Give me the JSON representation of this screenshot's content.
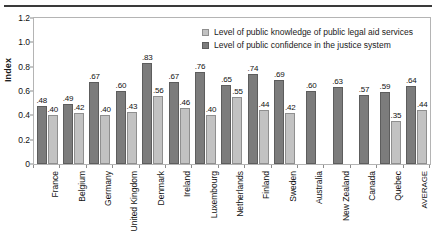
{
  "axis": {
    "ylabel": "Index",
    "yticks": [
      "0",
      "0.2",
      "0.4",
      "0.6",
      "0.8",
      "1.0",
      "1.2"
    ]
  },
  "legend": {
    "items": [
      {
        "label": "Level of public knowledge of public legal aid services",
        "swatch": "light",
        "color": "#c2c2c2"
      },
      {
        "label": "Level of public confidence in the justice system",
        "swatch": "dark",
        "color": "#7c7c7c"
      }
    ]
  },
  "chart_data": {
    "type": "bar",
    "title": "",
    "xlabel": "",
    "ylabel": "Index",
    "ylim": [
      0,
      1.2
    ],
    "ytick_step": 0.2,
    "grid": false,
    "legend_position": "top-right-inside",
    "categories": [
      "France",
      "Belgium",
      "Germany",
      "United Kingdom",
      "Denmark",
      "Ireland",
      "Luxembourg",
      "Netherlands",
      "Finland",
      "Sweden",
      "Australia",
      "New Zealand",
      "Canada",
      "Quebec",
      "AVERAGE"
    ],
    "series": [
      {
        "name": "Level of public confidence in the justice system",
        "color": "#7c7c7c",
        "values": [
          0.48,
          0.49,
          0.67,
          0.6,
          0.83,
          0.67,
          0.76,
          0.65,
          0.74,
          0.69,
          0.6,
          0.63,
          0.57,
          0.59,
          0.64
        ],
        "labels": [
          ".48",
          ".49",
          ".67",
          ".60",
          ".83",
          ".67",
          ".76",
          ".65",
          ".74",
          ".69",
          ".60",
          ".63",
          ".57",
          ".59",
          ".64"
        ]
      },
      {
        "name": "Level of public knowledge of public legal aid services",
        "color": "#c2c2c2",
        "values": [
          0.4,
          0.42,
          0.4,
          0.43,
          0.56,
          0.46,
          0.4,
          0.55,
          0.44,
          0.42,
          null,
          null,
          null,
          0.35,
          0.44
        ],
        "labels": [
          ".40",
          ".42",
          ".40",
          ".43",
          ".56",
          ".46",
          ".40",
          ".55",
          ".44",
          ".42",
          "",
          "",
          "",
          ".35",
          ".44"
        ]
      }
    ]
  }
}
